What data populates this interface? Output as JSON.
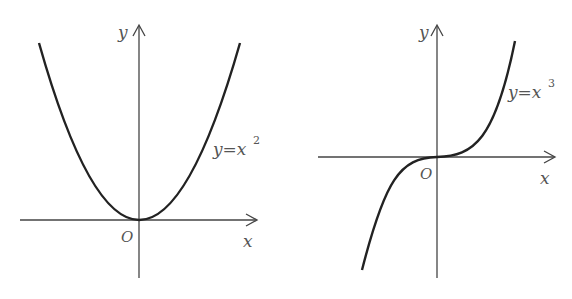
{
  "figures": [
    {
      "id": "parabola",
      "function_label": "y = x²",
      "label_y": "y",
      "label_eq_sign": "=",
      "label_x": "x",
      "label_exp": "2",
      "axis_x_label": "x",
      "axis_y_label": "y",
      "origin_label": "O"
    },
    {
      "id": "cubic",
      "function_label": "y = x³",
      "label_y": "y",
      "label_eq_sign": "=",
      "label_x": "x",
      "label_exp": "3",
      "axis_x_label": "x",
      "axis_y_label": "y",
      "origin_label": "O"
    }
  ],
  "colors": {
    "curve": "#222222",
    "axis": "#444444",
    "text": "#555555"
  }
}
